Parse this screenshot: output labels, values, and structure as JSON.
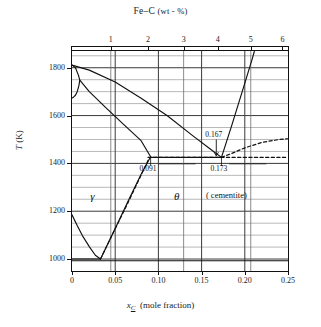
{
  "figure": {
    "top_title": "Fe–C",
    "top_title_units": "(wt - %)",
    "xlabel_var": "x",
    "xlabel_sub": "C",
    "xlabel_units": "(mole fraction)",
    "ylabel": "T (K)"
  },
  "chart_data": {
    "type": "line",
    "title": "Fe–C (wt - %)",
    "xlabel": "x_C (mole fraction)",
    "ylabel": "T (K)",
    "xlim": [
      0,
      0.25
    ],
    "ylim": [
      950,
      1870
    ],
    "grid": true,
    "legend": null,
    "x_ticks": [
      0,
      0.05,
      0.1,
      0.15,
      0.2,
      0.25
    ],
    "x_tick_labels": [
      "0",
      "0.05",
      "0.10",
      "0.15",
      "0.20",
      "0.25"
    ],
    "y_ticks": [
      1000,
      1200,
      1400,
      1600,
      1800
    ],
    "y_tick_labels": [
      "1000",
      "1200",
      "1400",
      "1600",
      "1800"
    ],
    "y_minor_ticks": [
      1050,
      1100,
      1150,
      1250,
      1300,
      1350,
      1450,
      1500,
      1550,
      1650,
      1700,
      1750,
      1850
    ],
    "secondary_x_axis": {
      "label": "Fe–C (wt - %)",
      "ticks": [
        1,
        2,
        3,
        4,
        5,
        6
      ],
      "tick_labels": [
        "1",
        "2",
        "3",
        "4",
        "5",
        "6"
      ],
      "tick_x_molefraction": [
        0.0449,
        0.0879,
        0.1292,
        0.1688,
        0.2069,
        0.2436
      ]
    },
    "annotations": [
      {
        "text": "0.167",
        "x": 0.167,
        "y": 1518,
        "kind": "arrow-label"
      },
      {
        "text": "0.173",
        "x": 0.173,
        "y": 1378,
        "kind": "tick-label"
      },
      {
        "text": "0.091",
        "x": 0.091,
        "y": 1378,
        "kind": "tick-label"
      },
      {
        "text": "γ",
        "x": 0.021,
        "y": 1258,
        "kind": "phase-label"
      },
      {
        "text": "θ",
        "x": 0.118,
        "y": 1258,
        "kind": "phase-label"
      },
      {
        "text": "( cementite)",
        "x": 0.155,
        "y": 1258,
        "kind": "phase-label"
      }
    ],
    "series": [
      {
        "name": "delta-liquidus-peritectic-peak",
        "style": "solid",
        "points": [
          [
            0.0,
            1811
          ],
          [
            0.004,
            1800
          ],
          [
            0.0075,
            1768
          ],
          [
            0.009,
            1748
          ],
          [
            0.008,
            1725
          ],
          [
            0.006,
            1700
          ],
          [
            0.004,
            1685
          ],
          [
            0.002,
            1678
          ],
          [
            0.0,
            1673
          ]
        ]
      },
      {
        "name": "liquidus-austenite",
        "style": "solid",
        "points": [
          [
            0.0,
            1811
          ],
          [
            0.02,
            1790
          ],
          [
            0.05,
            1740
          ],
          [
            0.08,
            1672
          ],
          [
            0.11,
            1600
          ],
          [
            0.14,
            1515
          ],
          [
            0.16,
            1460
          ],
          [
            0.173,
            1425
          ]
        ]
      },
      {
        "name": "solidus-austenite",
        "style": "solid",
        "points": [
          [
            0.009,
            1748
          ],
          [
            0.02,
            1700
          ],
          [
            0.04,
            1630
          ],
          [
            0.06,
            1562
          ],
          [
            0.08,
            1495
          ],
          [
            0.091,
            1428
          ]
        ]
      },
      {
        "name": "eutectic-horizontal",
        "style": "solid",
        "points": [
          [
            0.091,
            1425
          ],
          [
            0.173,
            1425
          ]
        ]
      },
      {
        "name": "eutectic-horizontal-dashed-overlay",
        "style": "dashed",
        "points": [
          [
            0.088,
            1425
          ],
          [
            0.25,
            1425
          ]
        ]
      },
      {
        "name": "cementite-liquidus",
        "style": "solid",
        "points": [
          [
            0.173,
            1425
          ],
          [
            0.185,
            1560
          ],
          [
            0.197,
            1700
          ],
          [
            0.208,
            1830
          ],
          [
            0.211,
            1868
          ]
        ]
      },
      {
        "name": "metastable-cementite-dashed",
        "style": "dashed",
        "points": [
          [
            0.173,
            1425
          ],
          [
            0.185,
            1442
          ],
          [
            0.2,
            1465
          ],
          [
            0.22,
            1488
          ],
          [
            0.24,
            1500
          ],
          [
            0.25,
            1503
          ]
        ]
      },
      {
        "name": "austenite-solvus",
        "style": "solid",
        "points": [
          [
            0.0,
            1185
          ],
          [
            0.006,
            1140
          ],
          [
            0.012,
            1098
          ],
          [
            0.02,
            1052
          ],
          [
            0.027,
            1016
          ],
          [
            0.033,
            1000
          ]
        ]
      },
      {
        "name": "gamma-theta-boundary",
        "style": "solid",
        "points": [
          [
            0.033,
            1000
          ],
          [
            0.05,
            1128
          ],
          [
            0.065,
            1243
          ],
          [
            0.08,
            1355
          ],
          [
            0.091,
            1428
          ]
        ]
      },
      {
        "name": "gamma-theta-boundary-metastable",
        "style": "dashed",
        "points": [
          [
            0.033,
            1000
          ],
          [
            0.048,
            1112
          ],
          [
            0.063,
            1222
          ],
          [
            0.078,
            1336
          ],
          [
            0.089,
            1420
          ]
        ]
      },
      {
        "name": "eutectoid-horizontal",
        "style": "solid",
        "points": [
          [
            0.0,
            1000
          ],
          [
            0.033,
            1000
          ]
        ]
      },
      {
        "name": "eutectoid-horizontal-long",
        "style": "solid",
        "points": [
          [
            0.0,
            993
          ],
          [
            0.25,
            993
          ]
        ]
      }
    ]
  }
}
